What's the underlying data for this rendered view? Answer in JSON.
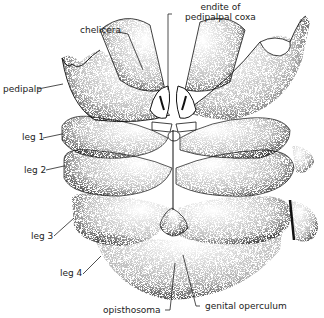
{
  "figure": {
    "colors": {
      "ink": "#111111",
      "paper": "#ffffff",
      "label": "#222222"
    }
  },
  "labels": {
    "endite": {
      "line1": "endite of",
      "line2": "pedipalpal coxa"
    },
    "chelicera": "chelicera",
    "pedipalp": "pedipalp",
    "leg1": "leg 1",
    "leg2": "leg 2",
    "leg3": "leg 3",
    "leg4": "leg 4",
    "opisthosoma": "opisthosoma",
    "genital_operculum": "genital operculum"
  }
}
